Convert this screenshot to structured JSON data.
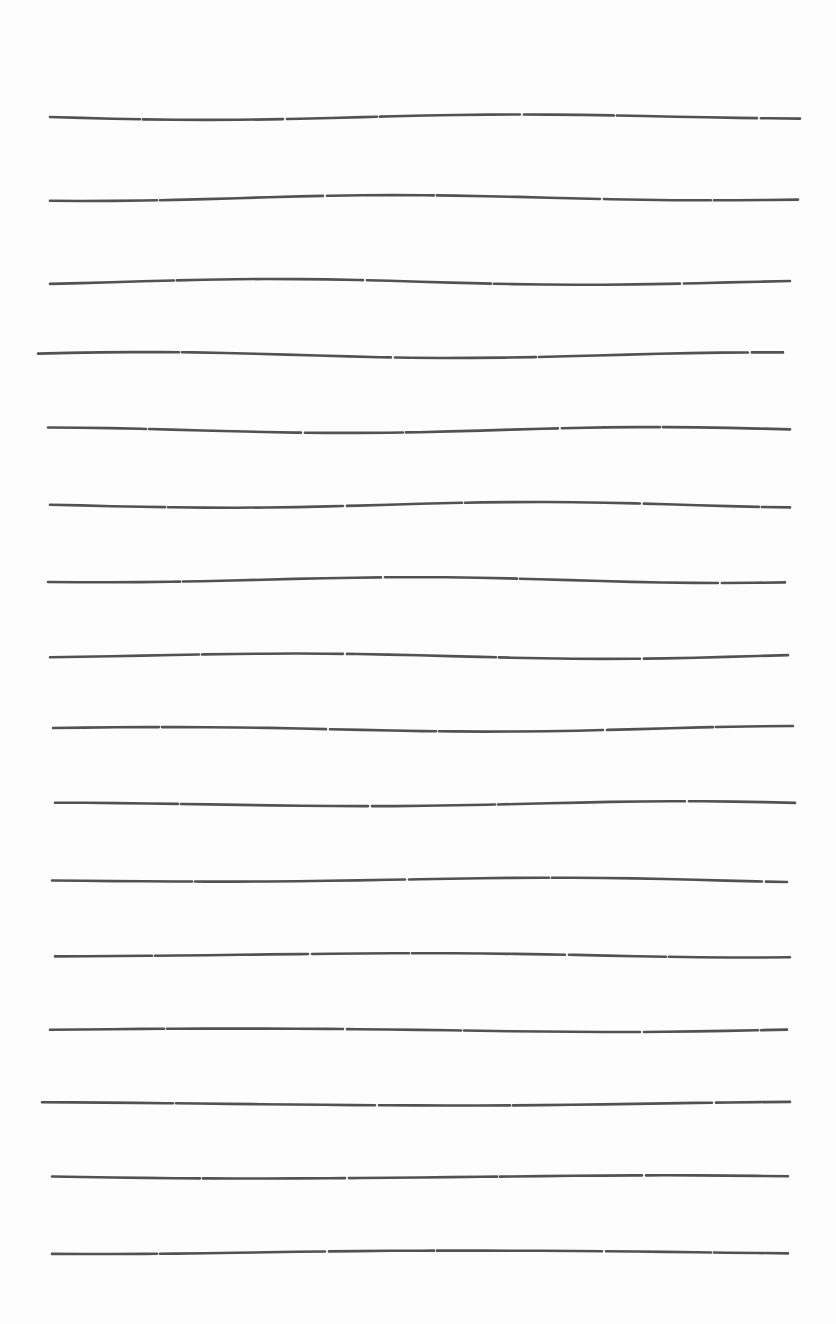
{
  "page": {
    "type": "blank lined sheet (scanned)",
    "background_color": "#fdfdfd",
    "line_color": "#3a3a3a",
    "line_count": 16,
    "lines": [
      {
        "y": 117,
        "x1": 50,
        "x2": 800
      },
      {
        "y": 198,
        "x1": 50,
        "x2": 798
      },
      {
        "y": 282,
        "x1": 50,
        "x2": 790
      },
      {
        "y": 355,
        "x1": 38,
        "x2": 783
      },
      {
        "y": 430,
        "x1": 48,
        "x2": 790
      },
      {
        "y": 505,
        "x1": 50,
        "x2": 790
      },
      {
        "y": 580,
        "x1": 48,
        "x2": 785
      },
      {
        "y": 656,
        "x1": 50,
        "x2": 788
      },
      {
        "y": 729,
        "x1": 53,
        "x2": 793
      },
      {
        "y": 804,
        "x1": 55,
        "x2": 795
      },
      {
        "y": 880,
        "x1": 52,
        "x2": 787
      },
      {
        "y": 955,
        "x1": 55,
        "x2": 790
      },
      {
        "y": 1030,
        "x1": 50,
        "x2": 787
      },
      {
        "y": 1104,
        "x1": 42,
        "x2": 790
      },
      {
        "y": 1177,
        "x1": 52,
        "x2": 788
      },
      {
        "y": 1252,
        "x1": 52,
        "x2": 788
      }
    ]
  }
}
